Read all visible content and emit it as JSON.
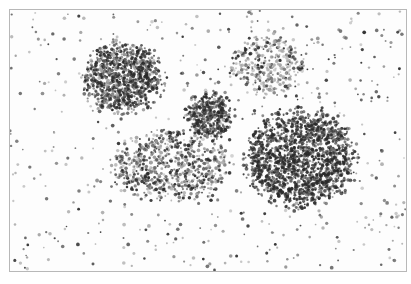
{
  "image": {
    "description": "Grayscale histology micrograph showing scattered cells with several dense cellular clusters",
    "tone": "grayscale",
    "colors": {
      "background": "#fdfdfd",
      "border": "#b8b8b8",
      "cell_dark": "#2a2a2a",
      "cell_mid": "#6a6a6a",
      "cell_light": "#a8a8a8"
    },
    "clusters": [
      {
        "name": "upper-left-cluster",
        "density": "high"
      },
      {
        "name": "upper-right-cluster",
        "density": "low"
      },
      {
        "name": "center-small-cluster",
        "density": "high"
      },
      {
        "name": "lower-center-cluster",
        "density": "medium"
      },
      {
        "name": "large-right-cluster",
        "density": "very-high"
      }
    ]
  }
}
